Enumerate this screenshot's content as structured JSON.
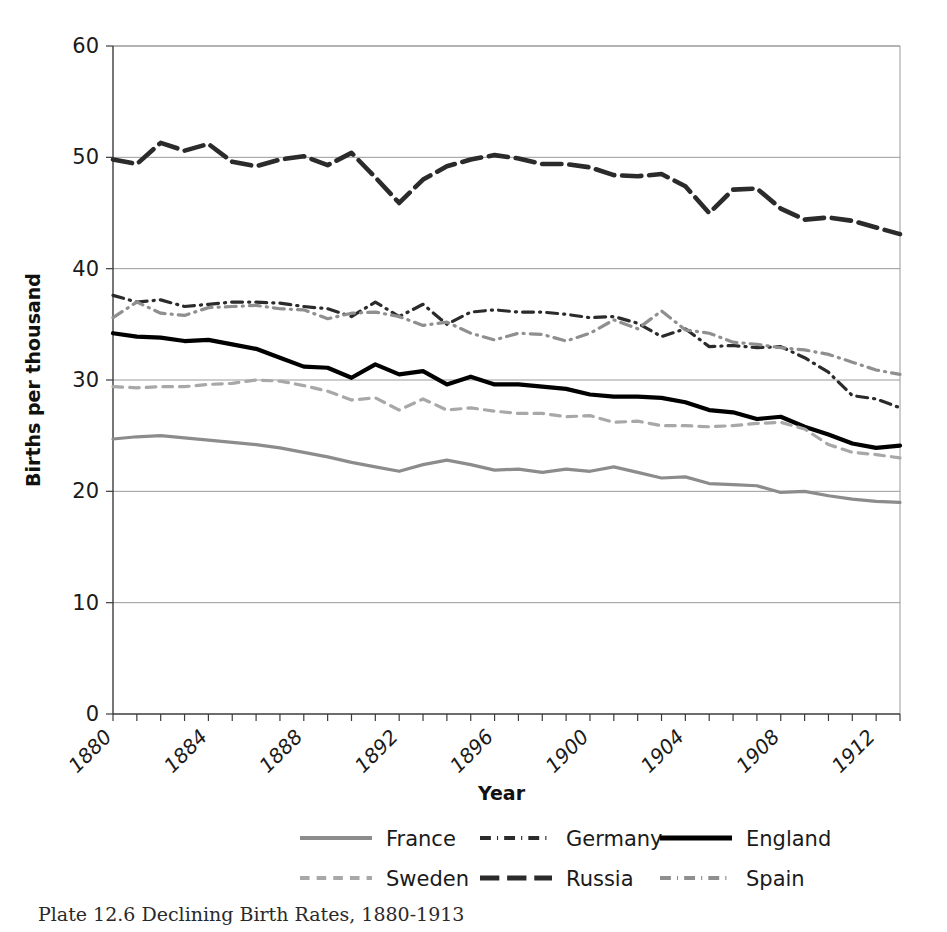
{
  "figure": {
    "caption": "Plate 12.6 Declining Birth Rates, 1880-1913"
  },
  "chart_data": {
    "type": "line",
    "title": "",
    "xlabel": "Year",
    "ylabel": "Births per thousand",
    "xlim": [
      1880,
      1913
    ],
    "ylim": [
      0,
      60
    ],
    "yticks": [
      0,
      10,
      20,
      30,
      40,
      50,
      60
    ],
    "ytick_labels": [
      "0",
      "10",
      "20",
      "30",
      "40",
      "50",
      "60"
    ],
    "xticks": [
      1880,
      1884,
      1888,
      1892,
      1896,
      1900,
      1904,
      1908,
      1912
    ],
    "xtick_labels": [
      "1880",
      "1884",
      "1888",
      "1892",
      "1896",
      "1900",
      "1904",
      "1908",
      "1912"
    ],
    "minor_xtick_step": 1,
    "grid": "horizontal",
    "legend_position": "bottom",
    "x": [
      1880,
      1881,
      1882,
      1883,
      1884,
      1885,
      1886,
      1887,
      1888,
      1889,
      1890,
      1891,
      1892,
      1893,
      1894,
      1895,
      1896,
      1897,
      1898,
      1899,
      1900,
      1901,
      1902,
      1903,
      1904,
      1905,
      1906,
      1907,
      1908,
      1909,
      1910,
      1911,
      1912,
      1913
    ],
    "series": [
      {
        "name": "France",
        "color": "#8c8c8c",
        "style": "solid",
        "width": 3.2,
        "values": [
          24.7,
          24.9,
          25.0,
          24.8,
          24.6,
          24.4,
          24.2,
          23.9,
          23.5,
          23.1,
          22.6,
          22.2,
          21.8,
          22.4,
          22.8,
          22.4,
          21.9,
          22.0,
          21.7,
          22.0,
          21.8,
          22.2,
          21.7,
          21.2,
          21.3,
          20.7,
          20.6,
          20.5,
          19.9,
          20.0,
          19.6,
          19.3,
          19.1,
          19.0
        ]
      },
      {
        "name": "Germany",
        "color": "#2b2b2b",
        "style": "dash-dot",
        "width": 3.2,
        "values": [
          37.6,
          37.0,
          37.2,
          36.6,
          36.8,
          37.0,
          37.0,
          36.9,
          36.6,
          36.4,
          35.7,
          37.0,
          35.7,
          36.8,
          35.0,
          36.1,
          36.3,
          36.1,
          36.1,
          35.9,
          35.6,
          35.7,
          35.1,
          33.9,
          34.6,
          33.0,
          33.1,
          32.9,
          33.0,
          32.0,
          30.7,
          28.6,
          28.3,
          27.5
        ]
      },
      {
        "name": "England",
        "color": "#000000",
        "style": "solid",
        "width": 4.2,
        "values": [
          34.2,
          33.9,
          33.8,
          33.5,
          33.6,
          33.2,
          32.8,
          32.0,
          31.2,
          31.1,
          30.2,
          31.4,
          30.5,
          30.8,
          29.6,
          30.3,
          29.6,
          29.6,
          29.4,
          29.2,
          28.7,
          28.5,
          28.5,
          28.4,
          28.0,
          27.3,
          27.1,
          26.5,
          26.7,
          25.8,
          25.1,
          24.3,
          23.9,
          24.1
        ]
      },
      {
        "name": "Sweden",
        "color": "#a8a8a8",
        "style": "dashed",
        "width": 3.2,
        "values": [
          29.4,
          29.3,
          29.4,
          29.4,
          29.6,
          29.7,
          30.0,
          29.9,
          29.5,
          29.0,
          28.2,
          28.4,
          27.3,
          28.3,
          27.3,
          27.5,
          27.2,
          27.0,
          27.0,
          26.7,
          26.8,
          26.2,
          26.3,
          25.9,
          25.9,
          25.8,
          25.9,
          26.1,
          26.2,
          25.6,
          24.2,
          23.5,
          23.3,
          23.0
        ]
      },
      {
        "name": "Russia",
        "color": "#2b2b2b",
        "style": "long-dash",
        "width": 4.6,
        "values": [
          49.8,
          49.4,
          51.3,
          50.6,
          51.2,
          49.6,
          49.2,
          49.8,
          50.1,
          49.3,
          50.4,
          48.2,
          45.9,
          48.0,
          49.2,
          49.8,
          50.2,
          49.9,
          49.4,
          49.4,
          49.1,
          48.4,
          48.3,
          48.5,
          47.4,
          45.0,
          47.1,
          47.2,
          45.4,
          44.4,
          44.6,
          44.3,
          43.7,
          43.1
        ]
      },
      {
        "name": "Spain",
        "color": "#8f8f8f",
        "style": "dash-dot",
        "width": 3.2,
        "values": [
          35.6,
          37.0,
          36.0,
          35.8,
          36.5,
          36.6,
          36.7,
          36.4,
          36.3,
          35.5,
          36.0,
          36.1,
          35.7,
          34.9,
          35.2,
          34.2,
          33.6,
          34.2,
          34.1,
          33.5,
          34.2,
          35.4,
          34.6,
          36.2,
          34.5,
          34.2,
          33.4,
          33.2,
          32.9,
          32.7,
          32.3,
          31.6,
          30.9,
          30.5
        ]
      }
    ],
    "legend_rows": [
      [
        "France",
        "Germany",
        "England"
      ],
      [
        "Sweden",
        "Russia",
        "Spain"
      ]
    ]
  }
}
